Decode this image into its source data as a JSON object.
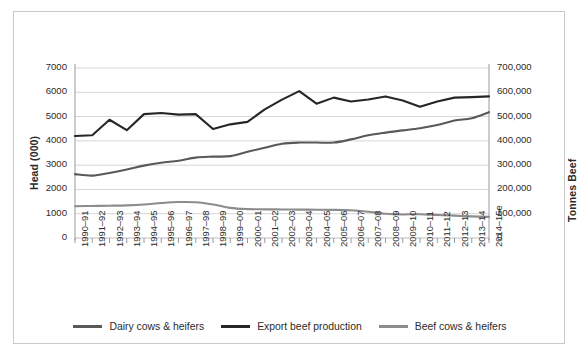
{
  "axes": {
    "left_title": "Head (000)",
    "right_title": "Tonnes Beef",
    "left_ticks": [
      "7000",
      "6000",
      "5000",
      "4000",
      "3000",
      "2000",
      "1000",
      "0"
    ],
    "right_ticks": [
      "700,000",
      "600,000",
      "500,000",
      "400,000",
      "300,000",
      "200,000",
      "100,000",
      "0"
    ]
  },
  "legend": {
    "items": [
      {
        "label": "Dairy cows & heifers",
        "color": "#595959"
      },
      {
        "label": "Export beef production",
        "color": "#262626"
      },
      {
        "label": "Beef cows & heifers",
        "color": "#8c8c8c"
      }
    ]
  },
  "chart_data": {
    "type": "line",
    "title": "",
    "xlabel": "",
    "ylabel": "Head (000)",
    "y2label": "Tonnes Beef",
    "ylim": [
      0,
      7000
    ],
    "y2lim": [
      0,
      700000
    ],
    "grid": true,
    "legend_position": "bottom",
    "categories": [
      "1990–91",
      "1991–92",
      "1992–93",
      "1993–94",
      "1994–95",
      "1995–96",
      "1996–97",
      "1997–98",
      "1998–99",
      "1999–00",
      "2000–01",
      "2001–02",
      "2002–03",
      "2003–04",
      "2004–05",
      "2005–06",
      "2006–07",
      "2007–08",
      "2008–09",
      "2009–10",
      "2010–11",
      "2011–12",
      "2012–13",
      "2013–14",
      "2014–15e"
    ],
    "series": [
      {
        "name": "Export beef production",
        "axis": "right",
        "color": "#262626",
        "unit": "tonnes",
        "values": [
          420000,
          423000,
          487000,
          444000,
          510000,
          515000,
          508000,
          510000,
          449000,
          468000,
          478000,
          530000,
          570000,
          605000,
          553000,
          578000,
          562000,
          570000,
          583000,
          566000,
          540000,
          562000,
          578000,
          580000,
          583000
        ]
      },
      {
        "name": "Dairy cows & heifers",
        "axis": "left",
        "color": "#595959",
        "unit": "head (000)",
        "values": [
          2630,
          2570,
          2680,
          2820,
          2980,
          3100,
          3180,
          3310,
          3350,
          3370,
          3550,
          3720,
          3880,
          3930,
          3930,
          3930,
          4060,
          4230,
          4340,
          4430,
          4520,
          4650,
          4840,
          4930,
          5180
        ]
      },
      {
        "name": "Beef cows & heifers",
        "axis": "left",
        "color": "#8c8c8c",
        "unit": "head (000)",
        "values": [
          1310,
          1320,
          1330,
          1345,
          1380,
          1440,
          1480,
          1470,
          1380,
          1240,
          1190,
          1180,
          1175,
          1170,
          1165,
          1160,
          1140,
          1080,
          1000,
          970,
          980,
          950,
          920,
          890,
          870
        ]
      }
    ]
  }
}
